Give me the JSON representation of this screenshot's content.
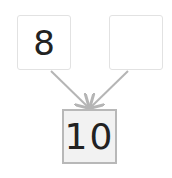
{
  "diagram": {
    "type": "number-bond",
    "parts": [
      {
        "id": "part-a",
        "value": "8"
      },
      {
        "id": "part-b",
        "value": ""
      }
    ],
    "whole": {
      "value": "10"
    },
    "colors": {
      "arrow": "#b5b5b5",
      "part_border": "#e2e2e2",
      "whole_border": "#b8b8b8",
      "whole_fill": "#f2f2f2"
    }
  }
}
